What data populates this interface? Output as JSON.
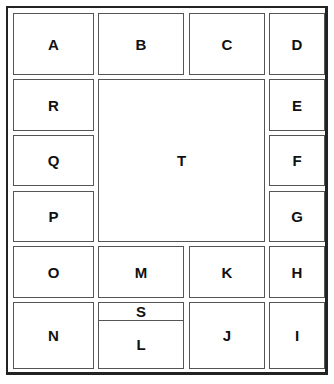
{
  "diagram": {
    "cells": {
      "A": "A",
      "B": "B",
      "C": "C",
      "D": "D",
      "E": "E",
      "F": "F",
      "G": "G",
      "H": "H",
      "I": "I",
      "J": "J",
      "K": "K",
      "L": "L",
      "M": "M",
      "N": "N",
      "O": "O",
      "P": "P",
      "Q": "Q",
      "R": "R",
      "S": "S",
      "T": "T"
    }
  }
}
